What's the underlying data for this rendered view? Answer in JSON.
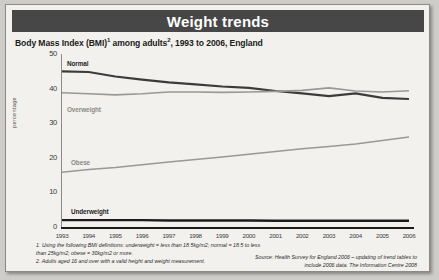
{
  "header": {
    "title": "Weight trends"
  },
  "subtitle": {
    "text_before": "Body Mass Index (BMI)",
    "sup1": "1",
    "text_mid": " among adults",
    "sup2": "2",
    "text_after": ", 1993 to 2006, England"
  },
  "footnotes": {
    "note1": "1. Using the following BMI definitions: underweight = less than 18.5kg/m2; normal = 18.5 to less than 25kg/m2; obese = 30kg/m2 or more.",
    "note2": "2. Adults aged 16 and over with a valid height and weight measurement."
  },
  "source": {
    "text": "Source: Health Survey for England 2006 – updating of trend tables to include 2006 data. The Information Centre 2008"
  },
  "colors": {
    "title_bar": "#474747",
    "card": "#f2f1ee",
    "normal": "#3b3b3b",
    "overweight": "#9a9894",
    "obese": "#9a9894",
    "underweight": "#1c1c1c"
  },
  "chart_data": {
    "type": "line",
    "xlabel": "",
    "ylabel": "percentage",
    "ylim": [
      0,
      50
    ],
    "yticks": [
      0,
      10,
      20,
      30,
      40,
      50
    ],
    "grid": false,
    "legend_position": "inline-labels",
    "x": [
      "1993",
      "1994",
      "1995",
      "1996",
      "1997",
      "1998",
      "1999",
      "2000",
      "2001",
      "2002",
      "2003",
      "2004",
      "2005",
      "2006"
    ],
    "series": [
      {
        "name": "Normal",
        "label": "Normal",
        "color": "#3b3b3b",
        "values": [
          45.0,
          44.8,
          43.5,
          42.6,
          41.8,
          41.2,
          40.6,
          40.2,
          39.3,
          38.6,
          37.8,
          38.6,
          37.3,
          37.0
        ]
      },
      {
        "name": "Overweight",
        "label": "Overweight",
        "color": "#9a9894",
        "values": [
          38.8,
          38.5,
          38.2,
          38.5,
          39.0,
          39.0,
          38.9,
          39.0,
          39.2,
          39.5,
          40.2,
          39.3,
          39.0,
          39.4
        ]
      },
      {
        "name": "Obese",
        "label": "Obese",
        "color": "#9a9894",
        "values": [
          15.8,
          16.6,
          17.2,
          18.0,
          18.8,
          19.5,
          20.2,
          21.0,
          21.8,
          22.6,
          23.3,
          24.0,
          25.0,
          26.0
        ]
      },
      {
        "name": "Underweight",
        "label": "Underweight",
        "color": "#1c1c1c",
        "values": [
          2.0,
          2.0,
          2.0,
          2.0,
          1.9,
          1.9,
          1.9,
          1.9,
          1.8,
          1.8,
          1.8,
          1.8,
          1.8,
          1.8
        ]
      }
    ]
  }
}
